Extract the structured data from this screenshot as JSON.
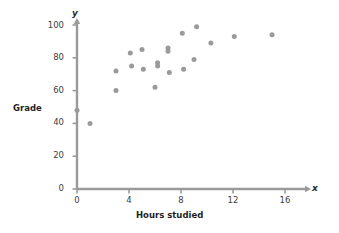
{
  "chart_data": {
    "type": "scatter",
    "title": "",
    "xlabel": "Hours studied",
    "ylabel": "Grade",
    "x_axis_variable": "x",
    "y_axis_variable": "y",
    "xlim": [
      0,
      16
    ],
    "ylim": [
      0,
      100
    ],
    "xticks": [
      0,
      4,
      8,
      12,
      16
    ],
    "yticks": [
      0,
      20,
      40,
      60,
      80,
      100
    ],
    "xtick_labels": [
      "0",
      "4",
      "8",
      "12",
      "16"
    ],
    "ytick_labels": [
      "0",
      "20",
      "40",
      "60",
      "80",
      "100"
    ],
    "grid": false,
    "legend": null,
    "marker_color": "#9a9a9a",
    "axis_color": "#9a9a9a",
    "points": [
      {
        "x": 0.0,
        "y": 48
      },
      {
        "x": 1.0,
        "y": 40
      },
      {
        "x": 3.0,
        "y": 60
      },
      {
        "x": 3.0,
        "y": 72
      },
      {
        "x": 4.1,
        "y": 83
      },
      {
        "x": 4.2,
        "y": 75
      },
      {
        "x": 5.0,
        "y": 85
      },
      {
        "x": 5.1,
        "y": 73
      },
      {
        "x": 6.0,
        "y": 62
      },
      {
        "x": 6.2,
        "y": 77
      },
      {
        "x": 6.2,
        "y": 75
      },
      {
        "x": 7.0,
        "y": 86
      },
      {
        "x": 7.0,
        "y": 84
      },
      {
        "x": 7.1,
        "y": 71
      },
      {
        "x": 8.1,
        "y": 95
      },
      {
        "x": 8.2,
        "y": 73
      },
      {
        "x": 9.0,
        "y": 79
      },
      {
        "x": 9.2,
        "y": 99
      },
      {
        "x": 10.3,
        "y": 89
      },
      {
        "x": 12.1,
        "y": 93
      },
      {
        "x": 15.0,
        "y": 94
      }
    ]
  },
  "figure": {
    "name": "scatter-plot-grade-vs-hours-studied"
  }
}
